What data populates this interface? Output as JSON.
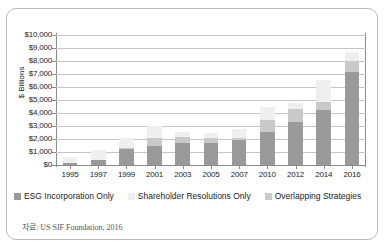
{
  "chart_data": {
    "type": "bar",
    "stacked": true,
    "title": "",
    "xlabel": "",
    "ylabel": "$ Billions",
    "ylim": [
      0,
      10000
    ],
    "ytick_step": 1000,
    "grid": true,
    "legend_position": "bottom",
    "categories": [
      "1995",
      "1997",
      "1999",
      "2001",
      "2003",
      "2005",
      "2007",
      "2010",
      "2012",
      "2014",
      "2016"
    ],
    "ytick_labels": [
      "$0",
      "$1,000",
      "$2,000",
      "$3,000",
      "$4,000",
      "$5,000",
      "$6,000",
      "$7,000",
      "$8,000",
      "$9,000",
      "$10,000"
    ],
    "series": [
      {
        "name": "ESG Incorporation Only",
        "color": "#9a9a9a",
        "values": [
          166,
          421,
          1212,
          1497,
          1685,
          1685,
          1917,
          2512,
          3314,
          4270,
          7129
        ]
      },
      {
        "name": "Shareholder Resolutions Only",
        "color": "#efefef",
        "values": [
          473,
          736,
          777,
          897,
          448,
          378,
          739,
          980,
          473,
          1722,
          731
        ]
      },
      {
        "name": "Overlapping Strategies",
        "color": "#c9c9c9",
        "values": [
          0,
          0,
          106,
          592,
          441,
          398,
          151,
          981,
          1013,
          578,
          846
        ]
      }
    ],
    "totals": [
      639,
      1157,
      2095,
      2986,
      2574,
      2461,
      2807,
      4473,
      4800,
      6570,
      8706
    ],
    "source_note": "자료: US SIF Foundation, 2016"
  },
  "legend": {
    "items": [
      {
        "label": "ESG Incorporation Only"
      },
      {
        "label": "Shareholder Resolutions Only"
      },
      {
        "label": "Overlapping Strategies"
      }
    ]
  }
}
